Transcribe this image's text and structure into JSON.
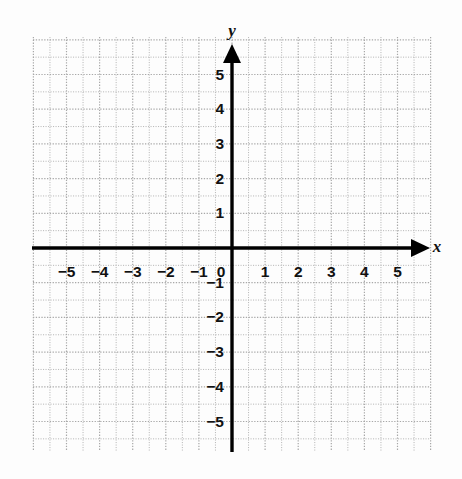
{
  "figure": {
    "title": "",
    "background_color": "#fdfdfd",
    "grid_color": "#b9b9b9",
    "axis_color": "#000000",
    "label_color": "#111111"
  },
  "chart_data": {
    "type": "scatter",
    "title": "",
    "subtitle": "",
    "xlabel": "x",
    "ylabel": "y",
    "xlim": [
      -6,
      6
    ],
    "ylim": [
      -6,
      6
    ],
    "xticks": [
      -5,
      -4,
      -3,
      -2,
      -1,
      0,
      1,
      2,
      3,
      4,
      5
    ],
    "yticks": [
      5,
      4,
      3,
      2,
      1,
      -1,
      -2,
      -3,
      -4,
      -5
    ],
    "xtick_labels": [
      "−5",
      "−4",
      "−3",
      "−2",
      "−1",
      "0",
      "1",
      "2",
      "3",
      "4",
      "5"
    ],
    "ytick_labels": [
      "5",
      "4",
      "3",
      "2",
      "1",
      "−1",
      "−2",
      "−3",
      "−4",
      "−5"
    ],
    "origin_label": "0",
    "grid": true,
    "grid_style": "dotted",
    "minor_grid": true,
    "legend": null,
    "series": [],
    "annotations": [],
    "x_axis_arrow": true,
    "y_axis_arrow": true
  },
  "axis_names": {
    "x": "x",
    "y": "y"
  },
  "x_labels": [
    {
      "text": "−5",
      "value": -5
    },
    {
      "text": "−4",
      "value": -4
    },
    {
      "text": "−3",
      "value": -3
    },
    {
      "text": "−2",
      "value": -2
    },
    {
      "text": "−1",
      "value": -1
    },
    {
      "text": "0",
      "value": 0
    },
    {
      "text": "1",
      "value": 1
    },
    {
      "text": "2",
      "value": 2
    },
    {
      "text": "3",
      "value": 3
    },
    {
      "text": "4",
      "value": 4
    },
    {
      "text": "5",
      "value": 5
    }
  ],
  "y_labels": [
    {
      "text": "5",
      "value": 5
    },
    {
      "text": "4",
      "value": 4
    },
    {
      "text": "3",
      "value": 3
    },
    {
      "text": "2",
      "value": 2
    },
    {
      "text": "1",
      "value": 1
    },
    {
      "text": "−1",
      "value": -1
    },
    {
      "text": "−2",
      "value": -2
    },
    {
      "text": "−3",
      "value": -3
    },
    {
      "text": "−4",
      "value": -4
    },
    {
      "text": "−5",
      "value": -5
    }
  ]
}
